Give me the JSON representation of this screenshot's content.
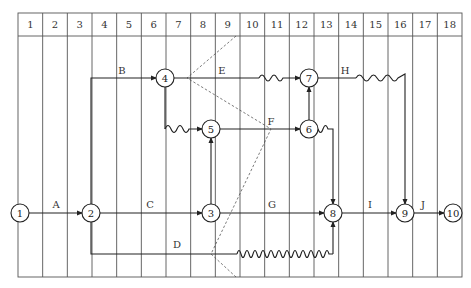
{
  "diagram": {
    "type": "time-scaled network (double-code) diagram",
    "grid": {
      "columns": [
        "1",
        "2",
        "3",
        "4",
        "5",
        "6",
        "7",
        "8",
        "9",
        "10",
        "11",
        "12",
        "13",
        "14",
        "15",
        "16",
        "17",
        "18"
      ],
      "left": 18,
      "right": 462,
      "header_top": 13,
      "header_bottom": 36,
      "bottom": 277
    },
    "nodes": [
      {
        "id": "1",
        "x": 20,
        "y": 213
      },
      {
        "id": "2",
        "x": 91,
        "y": 213
      },
      {
        "id": "3",
        "x": 211,
        "y": 213
      },
      {
        "id": "4",
        "x": 165,
        "y": 78
      },
      {
        "id": "5",
        "x": 211,
        "y": 129
      },
      {
        "id": "6",
        "x": 309,
        "y": 129
      },
      {
        "id": "7",
        "x": 309,
        "y": 78
      },
      {
        "id": "8",
        "x": 333,
        "y": 213
      },
      {
        "id": "9",
        "x": 405,
        "y": 213
      },
      {
        "id": "10",
        "x": 453,
        "y": 213
      }
    ],
    "activities": [
      {
        "label": "A",
        "from": "1",
        "to": "2",
        "label_x": 56,
        "label_y": 208
      },
      {
        "label": "B",
        "from": "2",
        "to": "4",
        "label_x": 122,
        "label_y": 74
      },
      {
        "label": "C",
        "from": "2",
        "to": "3",
        "label_x": 150,
        "label_y": 208
      },
      {
        "label": "D",
        "from": "2",
        "to": "8",
        "label_x": 177,
        "label_y": 248
      },
      {
        "label": "E",
        "from": "4",
        "to": "7",
        "label_x": 222,
        "label_y": 74
      },
      {
        "label": "F",
        "from": "5",
        "to": "6",
        "label_x": 271,
        "label_y": 125
      },
      {
        "label": "G",
        "from": "3",
        "to": "8",
        "label_x": 272,
        "label_y": 208
      },
      {
        "label": "H",
        "from": "7",
        "to": "9",
        "label_x": 345,
        "label_y": 74
      },
      {
        "label": "I",
        "from": "8",
        "to": "9",
        "label_x": 370,
        "label_y": 208
      },
      {
        "label": "J",
        "from": "9",
        "to": "10",
        "label_x": 423,
        "label_y": 208
      }
    ],
    "dummies": [
      {
        "from": "4",
        "to": "5"
      },
      {
        "from": "3",
        "to": "5"
      },
      {
        "from": "6",
        "to": "7"
      },
      {
        "from": "6",
        "to": "8"
      }
    ],
    "free_float_waves": [
      "4-5",
      "E",
      "H",
      "6-8",
      "D"
    ],
    "check_line": "dashed frontline through columns 9-10"
  }
}
